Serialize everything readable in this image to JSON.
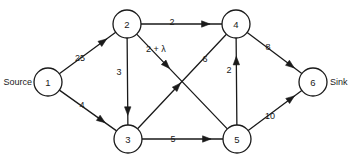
{
  "diagram": {
    "type": "directed-network-flow-graph",
    "width": 354,
    "height": 158,
    "background_color": "#ffffff",
    "line_color": "#1a1a1a",
    "terminals": {
      "source_label": "Source",
      "sink_label": "Sink"
    },
    "nodes": [
      {
        "id": "1",
        "label": "1",
        "cx": 48,
        "cy": 82,
        "r": 14
      },
      {
        "id": "2",
        "label": "2",
        "cx": 127,
        "cy": 24,
        "r": 14
      },
      {
        "id": "3",
        "label": "3",
        "cx": 128,
        "cy": 139,
        "r": 14
      },
      {
        "id": "4",
        "label": "4",
        "cx": 236,
        "cy": 24,
        "r": 14
      },
      {
        "id": "5",
        "label": "5",
        "cx": 237,
        "cy": 139,
        "r": 14
      },
      {
        "id": "6",
        "label": "6",
        "cx": 313,
        "cy": 82,
        "r": 14
      }
    ],
    "edges": [
      {
        "from": "1",
        "to": "2",
        "label": "25",
        "label_x": 80,
        "label_y": 58,
        "arrow_t": 0.78
      },
      {
        "from": "1",
        "to": "3",
        "label": "4",
        "label_x": 82,
        "label_y": 105,
        "arrow_t": 0.74
      },
      {
        "from": "2",
        "to": "4",
        "label": "2",
        "label_x": 172,
        "label_y": 22,
        "arrow_t": 0.8
      },
      {
        "from": "2",
        "to": "3",
        "label": "3",
        "label_x": 119,
        "label_y": 72,
        "arrow_t": 0.84
      },
      {
        "from": "2",
        "to": "5",
        "label": "2 + λ",
        "label_x": 156,
        "label_y": 49,
        "arrow_t": 0.33
      },
      {
        "from": "3",
        "to": "4",
        "label": "6",
        "label_x": 205,
        "label_y": 59,
        "arrow_t": 0.45
      },
      {
        "from": "3",
        "to": "5",
        "label": "5",
        "label_x": 173,
        "label_y": 139,
        "arrow_t": 0.8
      },
      {
        "from": "5",
        "to": "4",
        "label": "2",
        "label_x": 229,
        "label_y": 70,
        "arrow_t": 0.74
      },
      {
        "from": "4",
        "to": "6",
        "label": "8",
        "label_x": 268,
        "label_y": 47,
        "arrow_t": 0.8
      },
      {
        "from": "5",
        "to": "6",
        "label": "10",
        "label_x": 270,
        "label_y": 116,
        "arrow_t": 0.8
      }
    ]
  },
  "chart_data": {
    "type": "diagram",
    "title": "",
    "nodes": [
      "1",
      "2",
      "3",
      "4",
      "5",
      "6"
    ],
    "node_roles": {
      "1": "Source",
      "6": "Sink"
    },
    "edges": [
      {
        "from": "1",
        "to": "2",
        "capacity": "25"
      },
      {
        "from": "1",
        "to": "3",
        "capacity": "4"
      },
      {
        "from": "2",
        "to": "4",
        "capacity": "2"
      },
      {
        "from": "2",
        "to": "3",
        "capacity": "3"
      },
      {
        "from": "2",
        "to": "5",
        "capacity": "2 + λ"
      },
      {
        "from": "3",
        "to": "4",
        "capacity": "6"
      },
      {
        "from": "3",
        "to": "5",
        "capacity": "5"
      },
      {
        "from": "5",
        "to": "4",
        "capacity": "2"
      },
      {
        "from": "4",
        "to": "6",
        "capacity": "8"
      },
      {
        "from": "5",
        "to": "6",
        "capacity": "10"
      }
    ]
  }
}
